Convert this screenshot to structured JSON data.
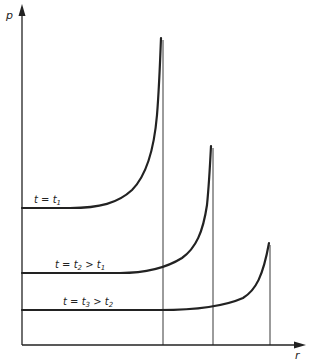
{
  "figure": {
    "type": "schematic-plot",
    "axes": {
      "y_label": "p",
      "x_label": "r"
    },
    "curves": [
      {
        "id": "t1",
        "label_prefix": "t = t",
        "label_sub": "1",
        "label_suffix": "",
        "label_suffix_sub": ""
      },
      {
        "id": "t2",
        "label_prefix": "t = t",
        "label_sub": "2",
        "label_suffix": " > t",
        "label_suffix_sub": "1"
      },
      {
        "id": "t3",
        "label_prefix": "t = t",
        "label_sub": "3",
        "label_suffix": " > t",
        "label_suffix_sub": "2"
      }
    ],
    "colors": {
      "line": "#222222",
      "background": "#ffffff"
    }
  }
}
